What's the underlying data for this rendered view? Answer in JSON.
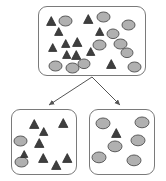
{
  "diagram": {
    "type": "set-partition-diagram",
    "canvas": {
      "width": 166,
      "height": 181
    },
    "colors": {
      "box_border": "#7a7a7a",
      "box_fill": "#ffffff",
      "triangle_fill": "#3f3f3f",
      "triangle_stroke": "#2a2a2a",
      "circle_fill": "#b0b0b0",
      "circle_stroke": "#5a5a5a",
      "arrow": "#555555",
      "background": "#ffffff"
    },
    "nodes": [
      {
        "id": "parent-set",
        "name": "parent-set-box",
        "x": 38,
        "y": 6,
        "width": 108,
        "height": 70,
        "counts": {
          "triangles": 11,
          "circles": 11,
          "total": 22
        },
        "shapes": [
          {
            "kind": "triangle",
            "cx": 12,
            "cy": 14,
            "size": 10
          },
          {
            "kind": "circle",
            "cx": 26,
            "cy": 14,
            "rx": 6.5,
            "ry": 5.0
          },
          {
            "kind": "triangle",
            "cx": 20,
            "cy": 24,
            "size": 9
          },
          {
            "kind": "triangle",
            "cx": 49,
            "cy": 12,
            "size": 10
          },
          {
            "kind": "circle",
            "cx": 64,
            "cy": 10,
            "rx": 6.5,
            "ry": 5.0
          },
          {
            "kind": "circle",
            "cx": 89,
            "cy": 18,
            "rx": 6.5,
            "ry": 5.0
          },
          {
            "kind": "triangle",
            "cx": 61,
            "cy": 24,
            "size": 9
          },
          {
            "kind": "triangle",
            "cx": 38,
            "cy": 35,
            "size": 10
          },
          {
            "kind": "circle",
            "cx": 60,
            "cy": 38,
            "rx": 6.5,
            "ry": 5.0
          },
          {
            "kind": "circle",
            "cx": 81,
            "cy": 37,
            "rx": 6.5,
            "ry": 5.0
          },
          {
            "kind": "triangle",
            "cx": 14,
            "cy": 40,
            "size": 9
          },
          {
            "kind": "triangle",
            "cx": 37,
            "cy": 48,
            "size": 10
          },
          {
            "kind": "triangle",
            "cx": 28,
            "cy": 47,
            "size": 9
          },
          {
            "kind": "circle",
            "cx": 16,
            "cy": 59,
            "rx": 6.5,
            "ry": 5.0
          },
          {
            "kind": "circle",
            "cx": 33,
            "cy": 61,
            "rx": 6.5,
            "ry": 5.0
          },
          {
            "kind": "triangle",
            "cx": 72,
            "cy": 57,
            "size": 10
          },
          {
            "kind": "circle",
            "cx": 95,
            "cy": 60,
            "rx": 6.5,
            "ry": 5.0
          },
          {
            "kind": "triangle",
            "cx": 27,
            "cy": 36,
            "size": 9
          },
          {
            "kind": "circle",
            "cx": 74,
            "cy": 27,
            "rx": 6.0,
            "ry": 4.8
          },
          {
            "kind": "circle",
            "cx": 45,
            "cy": 57,
            "rx": 6.0,
            "ry": 4.8
          },
          {
            "kind": "triangle",
            "cx": 52,
            "cy": 44,
            "size": 9
          },
          {
            "kind": "circle",
            "cx": 88,
            "cy": 46,
            "rx": 6.0,
            "ry": 4.8
          }
        ]
      },
      {
        "id": "child-set-left",
        "name": "child-set-left-box",
        "x": 11,
        "y": 109,
        "width": 66,
        "height": 66,
        "counts": {
          "triangles": 8,
          "circles": 2,
          "total": 10
        },
        "shapes": [
          {
            "kind": "triangle",
            "cx": 22,
            "cy": 14,
            "size": 10
          },
          {
            "kind": "triangle",
            "cx": 32,
            "cy": 21,
            "size": 9
          },
          {
            "kind": "triangle",
            "cx": 51,
            "cy": 13,
            "size": 10
          },
          {
            "kind": "circle",
            "cx": 8,
            "cy": 31,
            "rx": 6.5,
            "ry": 5.0
          },
          {
            "kind": "triangle",
            "cx": 27,
            "cy": 33,
            "size": 10
          },
          {
            "kind": "triangle",
            "cx": 31,
            "cy": 48,
            "size": 10
          },
          {
            "kind": "triangle",
            "cx": 44,
            "cy": 55,
            "size": 10
          },
          {
            "kind": "triangle",
            "cx": 55,
            "cy": 48,
            "size": 10
          },
          {
            "kind": "circle",
            "cx": 9,
            "cy": 52,
            "rx": 6.5,
            "ry": 5.0
          },
          {
            "kind": "triangle",
            "cx": 12,
            "cy": 44,
            "size": 8
          }
        ]
      },
      {
        "id": "child-set-right",
        "name": "child-set-right-box",
        "x": 89,
        "y": 109,
        "width": 66,
        "height": 66,
        "counts": {
          "triangles": 1,
          "circles": 6,
          "total": 7
        },
        "shapes": [
          {
            "kind": "circle",
            "cx": 13,
            "cy": 13,
            "rx": 7.0,
            "ry": 5.4
          },
          {
            "kind": "circle",
            "cx": 52,
            "cy": 12,
            "rx": 7.0,
            "ry": 5.4
          },
          {
            "kind": "triangle",
            "cx": 26,
            "cy": 23,
            "size": 10
          },
          {
            "kind": "circle",
            "cx": 48,
            "cy": 30,
            "rx": 7.0,
            "ry": 5.4
          },
          {
            "kind": "circle",
            "cx": 25,
            "cy": 36,
            "rx": 7.0,
            "ry": 5.4
          },
          {
            "kind": "circle",
            "cx": 9,
            "cy": 47,
            "rx": 7.0,
            "ry": 5.4
          },
          {
            "kind": "circle",
            "cx": 44,
            "cy": 50,
            "rx": 7.0,
            "ry": 5.4
          }
        ]
      }
    ],
    "edges": [
      {
        "id": "edge-to-left",
        "name": "arrow-parent-to-left-child",
        "from": "parent-set",
        "to": "child-set-left",
        "x1": 92,
        "y1": 77,
        "x2": 49,
        "y2": 105
      },
      {
        "id": "edge-to-right",
        "name": "arrow-parent-to-right-child",
        "from": "parent-set",
        "to": "child-set-right",
        "x1": 92,
        "y1": 77,
        "x2": 120,
        "y2": 105
      }
    ]
  }
}
